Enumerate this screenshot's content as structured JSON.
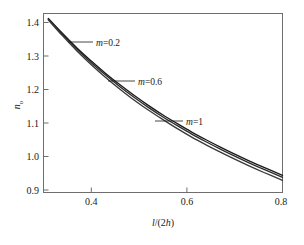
{
  "chart_data": {
    "type": "line",
    "title": "",
    "xlabel": "l/(2h)",
    "ylabel": "n_o",
    "xlabel_parts": {
      "italic1": "l",
      "roman1": "/(2",
      "italic2": "h",
      "roman2": ")"
    },
    "ylabel_parts": {
      "italic": "n",
      "sub": "o"
    },
    "xlim": [
      0.3,
      0.8
    ],
    "ylim": [
      0.88,
      1.43
    ],
    "xticks": [
      0.4,
      0.6,
      0.8
    ],
    "xtick_labels": [
      "0.4",
      "0.6",
      "0.8"
    ],
    "yticks": [
      0.9,
      1.0,
      1.1,
      1.2,
      1.3,
      1.4
    ],
    "ytick_labels": [
      "0.9",
      "1.0",
      "1.1",
      "1.2",
      "1.3",
      "1.4"
    ],
    "grid": false,
    "legend_position": "inline-annotations",
    "x": [
      0.31,
      0.34,
      0.37,
      0.4,
      0.43,
      0.46,
      0.49,
      0.52,
      0.55,
      0.58,
      0.61,
      0.64,
      0.67,
      0.7,
      0.73,
      0.76,
      0.8
    ],
    "series": [
      {
        "name": "m=0.2",
        "color": "#1a1a1a",
        "values": [
          1.412,
          1.367,
          1.324,
          1.285,
          1.248,
          1.214,
          1.182,
          1.152,
          1.124,
          1.098,
          1.073,
          1.05,
          1.028,
          1.007,
          0.987,
          0.968,
          0.944
        ]
      },
      {
        "name": "m=0.6",
        "color": "#2b2b2b",
        "values": [
          1.41,
          1.364,
          1.32,
          1.28,
          1.243,
          1.208,
          1.176,
          1.146,
          1.118,
          1.092,
          1.067,
          1.044,
          1.022,
          1.001,
          0.981,
          0.962,
          0.938
        ]
      },
      {
        "name": "m=1",
        "color": "#3a3a3a",
        "values": [
          1.408,
          1.36,
          1.315,
          1.274,
          1.236,
          1.201,
          1.168,
          1.138,
          1.11,
          1.083,
          1.058,
          1.035,
          1.013,
          0.992,
          0.972,
          0.953,
          0.929
        ]
      }
    ],
    "annotations": [
      {
        "text": "m=0.2",
        "italic_part": "m",
        "rest": "=0.2",
        "label_x": 98,
        "label_y": 45,
        "leader_from_x": 93,
        "leader_from_y": 42,
        "leader_to_x": 68,
        "leader_to_y": 42
      },
      {
        "text": "m=0.6",
        "italic_part": "m",
        "rest": "=0.6",
        "label_x": 140,
        "label_y": 84,
        "leader_from_x": 135,
        "leader_from_y": 81,
        "leader_to_x": 108,
        "leader_to_y": 81
      },
      {
        "text": "m=1",
        "italic_part": "m",
        "rest": "=1",
        "label_x": 188,
        "label_y": 124,
        "leader_from_x": 183,
        "leader_from_y": 121,
        "leader_to_x": 155,
        "leader_to_y": 121
      }
    ]
  },
  "colors": {
    "background": "#ffffff",
    "frame": "#6e6e6e",
    "text": "#1a1a1a"
  }
}
